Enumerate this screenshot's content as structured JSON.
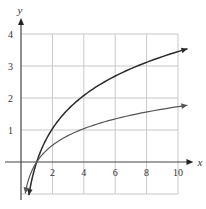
{
  "chart_data": {
    "type": "line",
    "title": "",
    "xlabel": "x",
    "ylabel": "y",
    "xlim": [
      0,
      10
    ],
    "ylim": [
      -1,
      4
    ],
    "grid": true,
    "x_ticks": [
      2,
      4,
      6,
      8,
      10
    ],
    "y_ticks": [
      1,
      2,
      3,
      4
    ],
    "legend": null,
    "series": [
      {
        "name": "upper curve (≈1.5·ln x)",
        "color": "#2b2b2b",
        "x": [
          0.5,
          1,
          2,
          4,
          6,
          8,
          10
        ],
        "values": [
          -1.0,
          0,
          1.04,
          2.08,
          2.69,
          3.12,
          3.45
        ]
      },
      {
        "name": "lower curve (≈0.75·ln x)",
        "color": "#555555",
        "x": [
          0.27,
          1,
          2,
          4,
          6,
          8,
          10
        ],
        "values": [
          -1.0,
          0,
          0.52,
          1.04,
          1.34,
          1.56,
          1.73
        ]
      }
    ]
  },
  "axes": {
    "x_label": "x",
    "y_label": "y",
    "x_tick_labels": [
      "2",
      "4",
      "6",
      "8",
      "10"
    ],
    "y_tick_labels": [
      "1",
      "2",
      "3",
      "4"
    ]
  }
}
